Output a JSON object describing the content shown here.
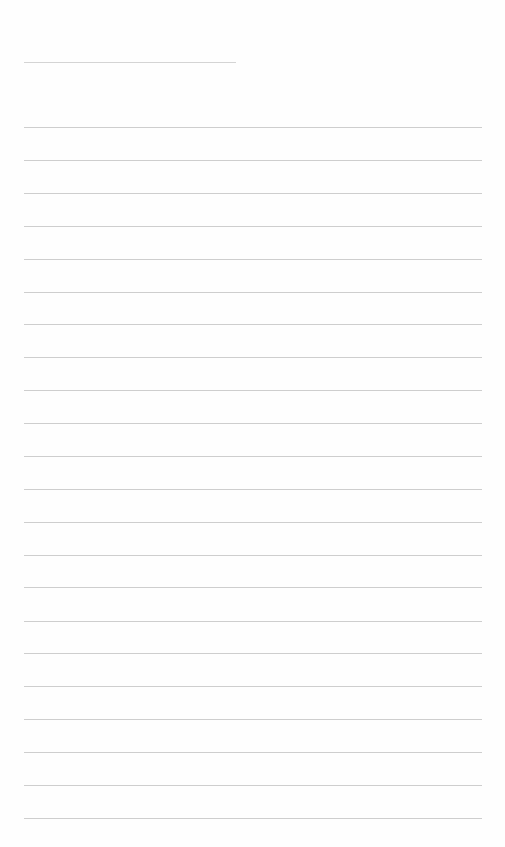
{
  "page": {
    "type": "blank lined sheet",
    "background": "#fefefe",
    "rule_color": "#c9c9c9",
    "header_rule": {
      "top": 62,
      "left": 24,
      "width": 212
    },
    "rules": {
      "left": 24,
      "width": 458,
      "tops": [
        127,
        160,
        193,
        226,
        259,
        292,
        324,
        357,
        390,
        423,
        456,
        489,
        522,
        555,
        587,
        621,
        653,
        686,
        719,
        752,
        785,
        818
      ]
    }
  }
}
